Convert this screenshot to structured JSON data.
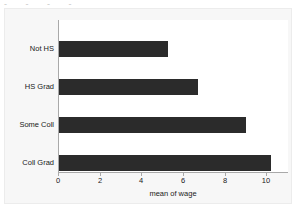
{
  "figure": {
    "background_color": "#f7f7f7",
    "plot_background_color": "#ffffff",
    "axis_color": "#a9a9a9",
    "bar_color": "#2b2b2b",
    "clipped_top_text": "-   -          -    -"
  },
  "chart_data": {
    "type": "bar",
    "orientation": "horizontal",
    "title": "",
    "subtitle": "",
    "xlabel": "mean of wage",
    "ylabel": "",
    "categories": [
      "Not HS",
      "HS Grad",
      "Some Coll",
      "Coll Grad"
    ],
    "values": [
      5.25,
      6.7,
      9.0,
      10.2
    ],
    "series": [
      {
        "name": "mean of wage",
        "values": [
          5.25,
          6.7,
          9.0,
          10.2
        ]
      }
    ],
    "xlim": [
      0,
      11
    ],
    "ylim": [
      0,
      4
    ],
    "xticks": [
      0,
      2,
      4,
      6,
      8,
      10
    ],
    "xtick_labels": [
      "0",
      "2",
      "4",
      "6",
      "8",
      "10"
    ],
    "yticks": [
      "Not HS",
      "HS Grad",
      "Some Coll",
      "Coll Grad"
    ],
    "grid": false,
    "legend": null,
    "legend_position": "none",
    "annotations": []
  }
}
